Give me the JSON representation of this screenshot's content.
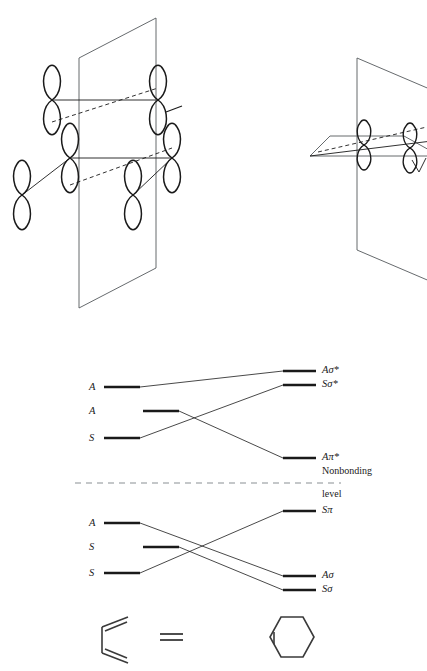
{
  "figure": {
    "background_color": "#ffffff",
    "ink_color": "#1a1a1a"
  },
  "orbital_panels": [
    {
      "name": "suprafacial-suprafacial-orbital-array-left",
      "description": "Six p orbitals arranged about a vertical mirror plane",
      "orbital_count": 6,
      "mirror_plane": "vertical"
    },
    {
      "name": "orbital-array-right",
      "description": "p orbitals on a horizontal plane intersecting a vertical mirror plane",
      "orbital_count": 2,
      "mirror_plane": "vertical"
    }
  ],
  "correlation_diagram": {
    "nonbonding": {
      "label_line1": "Nonbonding",
      "label_line2": "level",
      "y": 483,
      "x_start": 75,
      "x_end": 341
    },
    "reactant_levels": [
      {
        "id": "r1",
        "label": "A",
        "x1": 104,
        "x2": 140,
        "y": 387,
        "column": "outer"
      },
      {
        "id": "r2",
        "label": "A",
        "x1": 143,
        "x2": 179,
        "y": 411,
        "column": "inner"
      },
      {
        "id": "r3",
        "label": "S",
        "x1": 104,
        "x2": 140,
        "y": 438,
        "column": "outer"
      },
      {
        "id": "r4",
        "label": "A",
        "x1": 104,
        "x2": 140,
        "y": 523,
        "column": "outer"
      },
      {
        "id": "r5",
        "label": "S",
        "x1": 143,
        "x2": 179,
        "y": 547,
        "column": "inner"
      },
      {
        "id": "r6",
        "label": "S",
        "x1": 104,
        "x2": 140,
        "y": 573,
        "column": "outer"
      }
    ],
    "product_levels": [
      {
        "id": "p1",
        "label": "Aσ*",
        "base": "A",
        "sub": "σ",
        "star": true,
        "x1": 283,
        "x2": 316,
        "y": 371
      },
      {
        "id": "p2",
        "label": "Sσ*",
        "base": "S",
        "sub": "σ",
        "star": true,
        "x1": 283,
        "x2": 316,
        "y": 385
      },
      {
        "id": "p3",
        "label": "Aπ*",
        "base": "A",
        "sub": "π",
        "star": true,
        "x1": 283,
        "x2": 316,
        "y": 458
      },
      {
        "id": "p4",
        "label": "Sπ",
        "base": "S",
        "sub": "π",
        "star": false,
        "x1": 283,
        "x2": 316,
        "y": 511
      },
      {
        "id": "p5",
        "label": "Aσ",
        "base": "A",
        "sub": "σ",
        "star": false,
        "x1": 283,
        "x2": 316,
        "y": 576
      },
      {
        "id": "p6",
        "label": "Sσ",
        "base": "S",
        "sub": "σ",
        "star": false,
        "x1": 283,
        "x2": 316,
        "y": 590
      }
    ],
    "correlations": [
      {
        "from": "r1",
        "to": "p1",
        "from_x": 140,
        "from_y": 387,
        "to_x": 283,
        "to_y": 371
      },
      {
        "from": "r3",
        "to": "p2",
        "from_x": 140,
        "from_y": 438,
        "to_x": 283,
        "to_y": 385
      },
      {
        "from": "r2",
        "to": "p3",
        "from_x": 179,
        "from_y": 411,
        "to_x": 283,
        "to_y": 458
      },
      {
        "from": "r6",
        "to": "p4",
        "from_x": 140,
        "from_y": 573,
        "to_x": 283,
        "to_y": 511
      },
      {
        "from": "r4",
        "to": "p5",
        "from_x": 140,
        "from_y": 523,
        "to_x": 283,
        "to_y": 576
      },
      {
        "from": "r5",
        "to": "p6",
        "from_x": 179,
        "from_y": 547,
        "to_x": 283,
        "to_y": 590
      }
    ]
  },
  "reaction": {
    "reactant_label": "butadiene",
    "operator": "=",
    "product_label": "cyclohexene"
  }
}
